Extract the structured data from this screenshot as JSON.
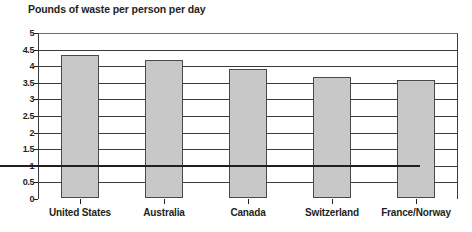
{
  "chart_data": {
    "type": "bar",
    "title": "Pounds of waste per person per day",
    "xlabel": "",
    "ylabel": "",
    "categories": [
      "United States",
      "Australia",
      "Canada",
      "Switzerland",
      "France/Norway"
    ],
    "values": [
      4.3,
      4.15,
      3.9,
      3.65,
      3.55
    ],
    "ylim": [
      0,
      5
    ],
    "ytick_labels": [
      "0",
      "0.5",
      "1",
      "1.5",
      "2",
      "2.5",
      "3",
      "3.5",
      "4",
      "4.5",
      "5"
    ],
    "ytick_values": [
      0,
      0.5,
      1,
      1.5,
      2,
      2.5,
      3,
      3.5,
      4,
      4.5,
      5
    ],
    "grid": true,
    "legend": "none",
    "bar_color": "#c8c8c8",
    "bar_border_color": "#4a4a4a",
    "grid_color": "#3a3a3a",
    "text_color": "#231f20"
  }
}
